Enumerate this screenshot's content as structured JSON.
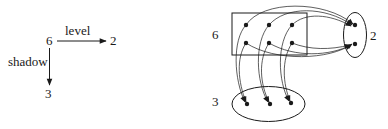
{
  "left_diagram": {
    "source_node": "6",
    "right_node": "2",
    "down_node": "3",
    "horizontal_edge_label": "level",
    "vertical_edge_label": "shadow"
  },
  "right_diagram": {
    "node_6_label": "6",
    "node_2_label": "2",
    "node_3_label": "3",
    "node_6_points": 6,
    "node_2_points": 2,
    "node_3_points": 3
  },
  "colors": {
    "stroke": "#1a1a1a",
    "background": "#ffffff"
  }
}
